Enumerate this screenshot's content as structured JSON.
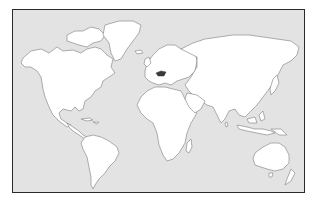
{
  "map": {
    "type": "world-outline",
    "projection": "equirectangular-like",
    "colors": {
      "ocean": "#e3e3e3",
      "land": "#ffffff",
      "coastline": "#8c8c8c",
      "frame": "#2a2a2a",
      "highlight": "#3a3a3a"
    },
    "highlighted_region": "central-europe-country",
    "continents": [
      "North America",
      "Greenland",
      "South America",
      "Europe",
      "Africa",
      "Asia",
      "Australia"
    ]
  }
}
